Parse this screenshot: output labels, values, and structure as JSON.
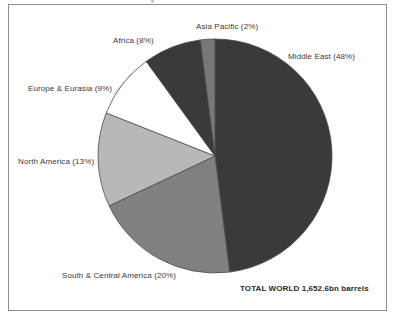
{
  "figure": {
    "frame_border_color": "#8f8f8f",
    "background": "#ffffff",
    "total_label": "TOTAL WORLD 1,652.6bn barrels"
  },
  "labels": {
    "asia_pacific": "Asia Pacific (2%)",
    "middle_east": "Middle East (48%)",
    "africa": "Africa (8%)",
    "europe_eurasia": "Europe & Eurasia (9%)",
    "north_america": "North America (13%)",
    "south_central_america": "South & Central America (20%)"
  },
  "chart_data": {
    "type": "pie",
    "title": "",
    "subtitle": "",
    "xlabel": "",
    "ylabel": "",
    "legend_position": "callout-labels",
    "grid": false,
    "annotations": [
      "TOTAL WORLD 1,652.6bn barrels"
    ],
    "total": "1,652.6bn barrels",
    "total_value": 1652.6,
    "units": "bn barrels",
    "start_angle_deg": 0,
    "direction": "clockwise",
    "categories": [
      "Middle East",
      "South & Central America",
      "North America",
      "Europe & Eurasia",
      "Africa",
      "Asia Pacific"
    ],
    "values": [
      48,
      20,
      13,
      9,
      8,
      2
    ],
    "value_unit": "percent",
    "slices": [
      {
        "name": "Middle East",
        "value": 48,
        "label": "Middle East (48%)",
        "color": "#3a3a3a",
        "start_deg": 0,
        "end_deg": 172.8
      },
      {
        "name": "South & Central America",
        "value": 20,
        "label": "South & Central America (20%)",
        "color": "#808080",
        "start_deg": 172.8,
        "end_deg": 244.8
      },
      {
        "name": "North America",
        "value": 13,
        "label": "North America (13%)",
        "color": "#b8b8b8",
        "start_deg": 244.8,
        "end_deg": 291.6
      },
      {
        "name": "Europe & Eurasia",
        "value": 9,
        "label": "Europe & Eurasia (9%)",
        "color": "#ffffff",
        "start_deg": 291.6,
        "end_deg": 324.0
      },
      {
        "name": "Africa",
        "value": 8,
        "label": "Africa (8%)",
        "color": "#3a3a3a",
        "start_deg": 324.0,
        "end_deg": 352.8
      },
      {
        "name": "Asia Pacific",
        "value": 2,
        "label": "Asia Pacific (2%)",
        "color": "#787878",
        "start_deg": 352.8,
        "end_deg": 360.0
      }
    ]
  }
}
